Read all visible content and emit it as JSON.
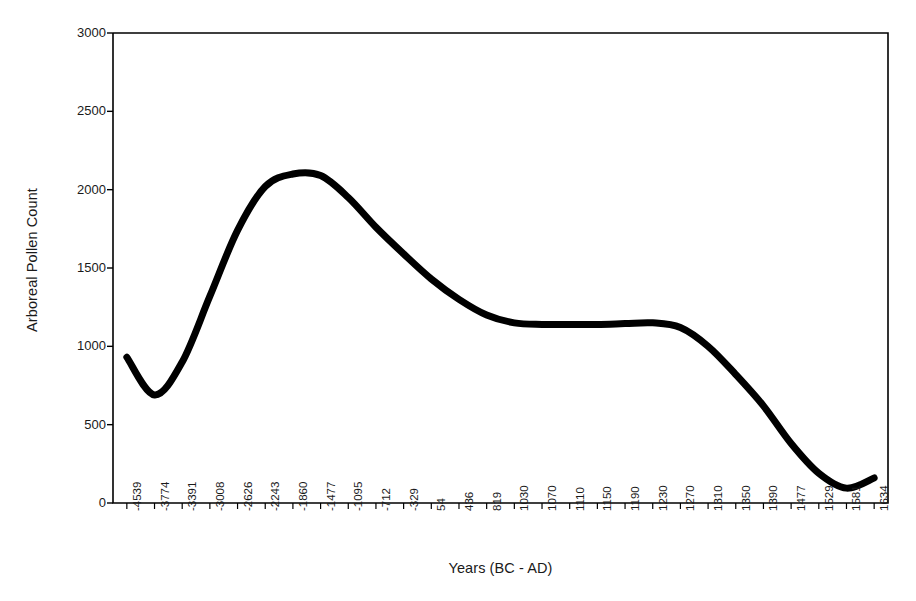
{
  "chart_data": {
    "type": "line",
    "title": "",
    "xlabel": "Years (BC - AD)",
    "ylabel": "Arboreal Pollen Count",
    "ylim": [
      0,
      3000
    ],
    "yticks": [
      0,
      500,
      1000,
      1500,
      2000,
      2500,
      3000
    ],
    "grid": false,
    "legend": null,
    "line_color": "#000000",
    "line_width": 7,
    "categories": [
      "-4539",
      "-3774",
      "-3391",
      "-3008",
      "-2626",
      "-2243",
      "-1860",
      "-1477",
      "-1095",
      "-712",
      "-329",
      "54",
      "436",
      "819",
      "1030",
      "1070",
      "1110",
      "1150",
      "1190",
      "1230",
      "1270",
      "1310",
      "1350",
      "1390",
      "1477",
      "1529",
      "1581",
      "1634"
    ],
    "series": [
      {
        "name": "Arboreal Pollen Count",
        "values": [
          930,
          690,
          900,
          1320,
          1740,
          2020,
          2100,
          2090,
          1950,
          1760,
          1590,
          1430,
          1300,
          1200,
          1150,
          1140,
          1140,
          1140,
          1145,
          1150,
          1120,
          1000,
          820,
          620,
          380,
          190,
          95,
          160
        ]
      }
    ]
  },
  "axes": {
    "y_title": "Arboreal Pollen Count",
    "x_title": "Years (BC - AD)",
    "y_tick_labels": [
      "3000",
      "2500",
      "2000",
      "1500",
      "1000",
      "500",
      "0"
    ],
    "x_tick_labels": [
      "-4539",
      "-3774",
      "-3391",
      "-3008",
      "-2626",
      "-2243",
      "-1860",
      "-1477",
      "-1095",
      "-712",
      "-329",
      "54",
      "436",
      "819",
      "1030",
      "1070",
      "1110",
      "1150",
      "1190",
      "1230",
      "1270",
      "1310",
      "1350",
      "1390",
      "1477",
      "1529",
      "1581",
      "1634"
    ]
  },
  "style": {
    "background": "#ffffff",
    "axis_color": "#000000",
    "text_color": "#1a1a1a"
  }
}
